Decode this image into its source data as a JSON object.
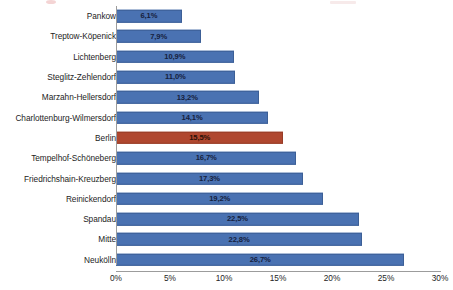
{
  "chart_data": {
    "type": "bar",
    "orientation": "horizontal",
    "title": "",
    "xlabel": "",
    "ylabel": "",
    "xlim": [
      0,
      30
    ],
    "grid": false,
    "legend": null,
    "axis_tick_labels": [
      "0%",
      "5%",
      "10%",
      "15%",
      "20%",
      "25%",
      "30%"
    ],
    "axis_tick_values": [
      0,
      5,
      10,
      15,
      20,
      25,
      30
    ],
    "value_suffix": "%",
    "decimal_separator": ",",
    "colors": {
      "bar": "#4a72b2",
      "bar_border": "#3c5f96",
      "highlight_bar": "#b0472f",
      "highlight_bar_border": "#973c27",
      "value_label": "#16213d",
      "axis": "#9c9c9c",
      "background": "#ffffff"
    },
    "highlight_category": "Berlin",
    "categories": [
      "Pankow",
      "Treptow-Köpenick",
      "Lichtenberg",
      "Steglitz-Zehlendorf",
      "Marzahn-Hellersdorf",
      "Charlottenburg-Wilmersdorf",
      "Berlin",
      "Tempelhof-Schöneberg",
      "Friedrichshain-Kreuzberg",
      "Reinickendorf",
      "Spandau",
      "Mitte",
      "Neukölln"
    ],
    "values": [
      6.1,
      7.9,
      10.9,
      11.0,
      13.2,
      14.1,
      15.5,
      16.7,
      17.3,
      19.2,
      22.5,
      22.8,
      26.7
    ],
    "value_labels": [
      "6,1%",
      "7,9%",
      "10,9%",
      "11,0%",
      "13,2%",
      "14,1%",
      "15,5%",
      "16,7%",
      "17,3%",
      "19,2%",
      "22,5%",
      "22,8%",
      "26,7%"
    ],
    "bars": [
      {
        "category": "Pankow",
        "value": 6.1,
        "label": "6,1%",
        "highlight": false
      },
      {
        "category": "Treptow-Köpenick",
        "value": 7.9,
        "label": "7,9%",
        "highlight": false
      },
      {
        "category": "Lichtenberg",
        "value": 10.9,
        "label": "10,9%",
        "highlight": false
      },
      {
        "category": "Steglitz-Zehlendorf",
        "value": 11.0,
        "label": "11,0%",
        "highlight": false
      },
      {
        "category": "Marzahn-Hellersdorf",
        "value": 13.2,
        "label": "13,2%",
        "highlight": false
      },
      {
        "category": "Charlottenburg-Wilmersdorf",
        "value": 14.1,
        "label": "14,1%",
        "highlight": false
      },
      {
        "category": "Berlin",
        "value": 15.5,
        "label": "15,5%",
        "highlight": true
      },
      {
        "category": "Tempelhof-Schöneberg",
        "value": 16.7,
        "label": "16,7%",
        "highlight": false
      },
      {
        "category": "Friedrichshain-Kreuzberg",
        "value": 17.3,
        "label": "17,3%",
        "highlight": false
      },
      {
        "category": "Reinickendorf",
        "value": 19.2,
        "label": "19,2%",
        "highlight": false
      },
      {
        "category": "Spandau",
        "value": 22.5,
        "label": "22,5%",
        "highlight": false
      },
      {
        "category": "Mitte",
        "value": 22.8,
        "label": "22,8%",
        "highlight": false
      },
      {
        "category": "Neukölln",
        "value": 26.7,
        "label": "26,7%",
        "highlight": false
      }
    ]
  }
}
